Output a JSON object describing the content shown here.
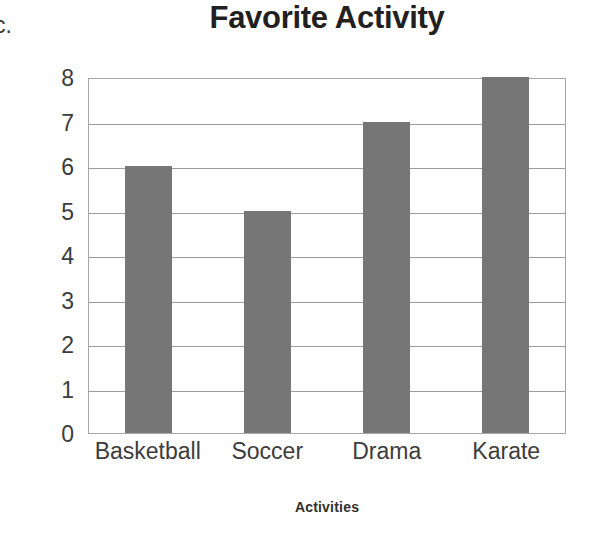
{
  "problem_label": "c.",
  "chart_data": {
    "type": "bar",
    "title": "Favorite Activity",
    "xlabel": "Activities",
    "ylabel": "Number of Classmates",
    "categories": [
      "Basketball",
      "Soccer",
      "Drama",
      "Karate"
    ],
    "values": [
      6,
      5,
      7,
      8
    ],
    "ylim": [
      0,
      8
    ],
    "ytick_labels": [
      "8",
      "7",
      "6",
      "5",
      "4",
      "3",
      "2",
      "1",
      "0"
    ],
    "ytick_values": [
      8,
      7,
      6,
      5,
      4,
      3,
      2,
      1,
      0
    ],
    "grid": true,
    "legend": false,
    "bar_color": "#767676",
    "gridline_color": "#9d9d9d",
    "plot_border_color": "#a6a6a6",
    "background_color": "#ffffff",
    "text_color": "#3c3c3c",
    "title_color": "#231f20"
  }
}
